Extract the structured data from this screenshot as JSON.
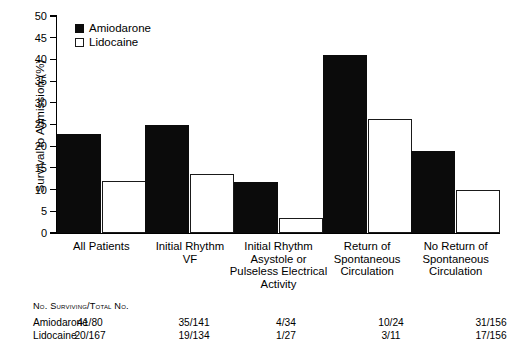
{
  "chart_data": {
    "type": "bar",
    "title": "",
    "xlabel": "",
    "ylabel": "Survival to Admission (%)",
    "ylim": [
      0,
      50
    ],
    "yticks": [
      0,
      5,
      10,
      15,
      20,
      25,
      30,
      35,
      40,
      45,
      50
    ],
    "grid": false,
    "legend_position": "top-left-inside",
    "categories": [
      "All Patients",
      "Initial Rhythm\nVF",
      "Initial Rhythm\nAsystole or\nPulseless Electrical\nActivity",
      "Return of\nSpontaneous\nCirculation",
      "No Return of\nSpontaneous\nCirculation"
    ],
    "series": [
      {
        "name": "Amiodarone",
        "style": "filled",
        "color": "#0b0b0b",
        "values": [
          22.8,
          24.8,
          11.8,
          41.0,
          18.8
        ]
      },
      {
        "name": "Lidocaine",
        "style": "open",
        "color": "#ffffff",
        "values": [
          12.0,
          13.5,
          3.4,
          26.3,
          9.8
        ]
      }
    ]
  },
  "legend": {
    "items": [
      {
        "label": "Amiodarone",
        "marker": "filled-square"
      },
      {
        "label": "Lidocaine",
        "marker": "open-square"
      }
    ]
  },
  "axes": {
    "y_title": "Survival to Admission (%)",
    "y_tick_labels": [
      "50",
      "45",
      "40",
      "35",
      "30",
      "25",
      "20",
      "15",
      "10",
      "5",
      "0"
    ]
  },
  "category_labels": [
    {
      "lines": [
        "All Patients"
      ]
    },
    {
      "lines": [
        "Initial Rhythm",
        "VF"
      ]
    },
    {
      "lines": [
        "Initial Rhythm",
        "Asystole or",
        "Pulseless Electrical",
        "Activity"
      ]
    },
    {
      "lines": [
        "Return of",
        "Spontaneous",
        "Circulation"
      ]
    },
    {
      "lines": [
        "No Return of",
        "Spontaneous",
        "Circulation"
      ]
    }
  ],
  "table": {
    "header": "No. Surviving/Total No.",
    "rows": [
      {
        "label": "Amiodarone",
        "cells": [
          "41/80",
          "35/141",
          "4/34",
          "10/24",
          "31/156"
        ]
      },
      {
        "label": "Lidocaine",
        "cells": [
          "20/167",
          "19/134",
          "1/27",
          "3/11",
          "17/156"
        ]
      }
    ]
  }
}
